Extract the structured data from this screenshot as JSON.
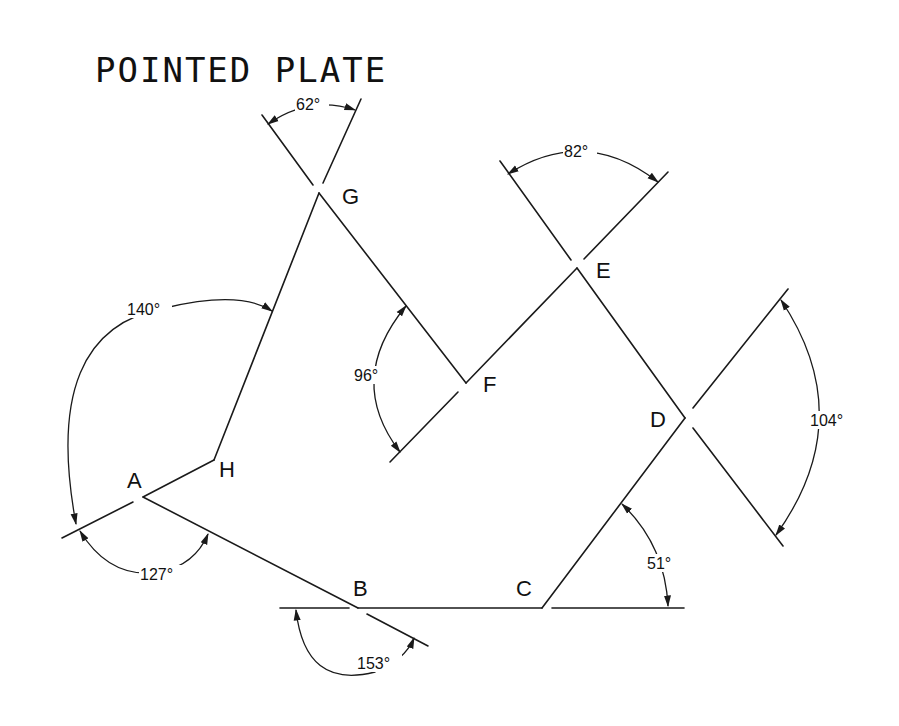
{
  "title": "POINTED PLATE",
  "vertices": {
    "A": {
      "label": "A",
      "x": 143,
      "y": 497
    },
    "B": {
      "label": "B",
      "x": 358,
      "y": 608
    },
    "C": {
      "label": "C",
      "x": 542,
      "y": 608
    },
    "D": {
      "label": "D",
      "x": 685,
      "y": 418
    },
    "E": {
      "label": "E",
      "x": 577,
      "y": 268
    },
    "F": {
      "label": "F",
      "x": 466,
      "y": 383
    },
    "G": {
      "label": "G",
      "x": 319,
      "y": 193
    },
    "H": {
      "label": "H",
      "x": 214,
      "y": 460
    }
  },
  "angles": {
    "A_outer": "140°",
    "A_inner": "127°",
    "B": "153°",
    "C": "51°",
    "D": "104°",
    "E": "82°",
    "F": "96°",
    "G": "62°"
  },
  "colors": {
    "line": "#1a1a1a",
    "background": "#ffffff"
  }
}
